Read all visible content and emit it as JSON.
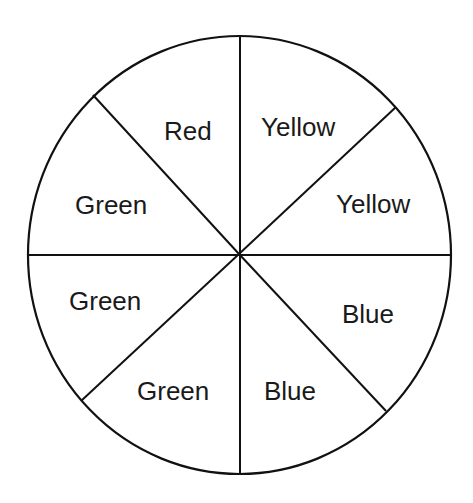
{
  "diagram": {
    "type": "spinner",
    "sections_count": 8,
    "line_color": "#111111",
    "background": "#ffffff",
    "sections": [
      {
        "index": 0,
        "label": "Yellow",
        "position": "top-right-upper"
      },
      {
        "index": 1,
        "label": "Yellow",
        "position": "top-right-lower"
      },
      {
        "index": 2,
        "label": "Blue",
        "position": "bottom-right-upper"
      },
      {
        "index": 3,
        "label": "Blue",
        "position": "bottom-right-lower"
      },
      {
        "index": 4,
        "label": "Green",
        "position": "bottom-left-lower"
      },
      {
        "index": 5,
        "label": "Green",
        "position": "bottom-left-upper"
      },
      {
        "index": 6,
        "label": "Green",
        "position": "top-left-lower"
      },
      {
        "index": 7,
        "label": "Red",
        "position": "top-left-upper"
      }
    ],
    "counts": {
      "Red": 1,
      "Yellow": 2,
      "Blue": 2,
      "Green": 3
    }
  }
}
